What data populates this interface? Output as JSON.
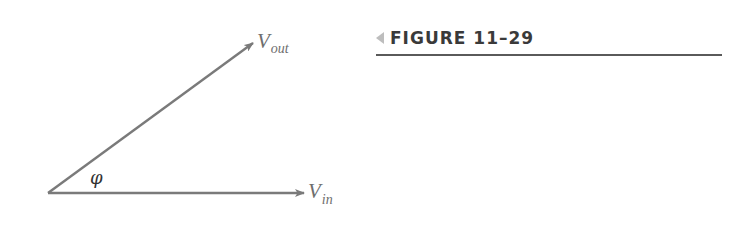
{
  "figure": {
    "label": "FIGURE 11–29",
    "marker_color": "#bdbdbd",
    "rule_color": "#5a5a5a"
  },
  "phasor_diagram": {
    "line_color": "#7a7a7a",
    "label_color": "#6e6e6e",
    "origin": {
      "x": 48,
      "y": 193
    },
    "vectors": [
      {
        "name": "V_out",
        "main": "V",
        "sub": "out",
        "tip": {
          "x": 253,
          "y": 43
        }
      },
      {
        "name": "V_in",
        "main": "V",
        "sub": "in",
        "tip": {
          "x": 304,
          "y": 193
        }
      }
    ],
    "angle_label": "φ"
  }
}
